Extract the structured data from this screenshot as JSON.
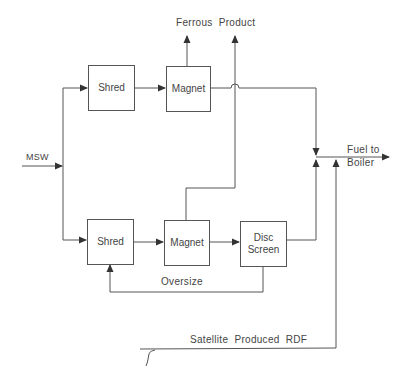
{
  "diagram": {
    "type": "process-flow",
    "nodes": {
      "shred_top": {
        "label": "Shred"
      },
      "magnet_top": {
        "label": "Magnet"
      },
      "shred_bottom": {
        "label": "Shred"
      },
      "magnet_bottom": {
        "label": "Magnet"
      },
      "disc_screen_line1": "Disc",
      "disc_screen_line2": "Screen"
    },
    "labels": {
      "input": "MSW",
      "ferrous_product": "Ferrous  Product",
      "fuel_line1": "Fuel to",
      "fuel_line2": "Boiler",
      "oversize": "Oversize",
      "satellite": "Satellite  Produced  RDF"
    },
    "edges": [
      {
        "from": "MSW",
        "to": "Shred (top)"
      },
      {
        "from": "MSW",
        "to": "Shred (bottom)"
      },
      {
        "from": "Shred (top)",
        "to": "Magnet (top)"
      },
      {
        "from": "Magnet (top)",
        "to": "Ferrous Product"
      },
      {
        "from": "Magnet (top)",
        "to": "Fuel to Boiler"
      },
      {
        "from": "Shred (bottom)",
        "to": "Magnet (bottom)"
      },
      {
        "from": "Magnet (bottom)",
        "to": "Ferrous Product"
      },
      {
        "from": "Magnet (bottom)",
        "to": "Disc Screen"
      },
      {
        "from": "Disc Screen",
        "to": "Fuel to Boiler"
      },
      {
        "from": "Disc Screen",
        "to": "Shred (bottom)",
        "label": "Oversize"
      },
      {
        "from": "Satellite Produced RDF",
        "to": "Fuel to Boiler"
      }
    ]
  }
}
